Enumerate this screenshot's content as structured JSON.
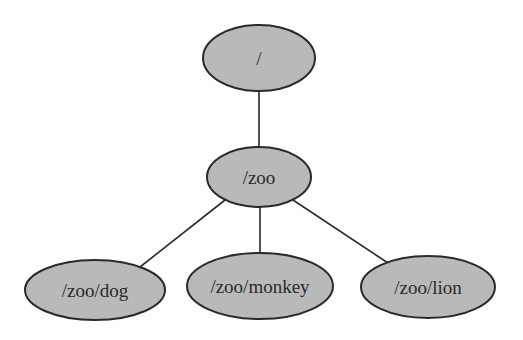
{
  "diagram": {
    "type": "tree",
    "fill_color": "#b9b9b9",
    "stroke_color": "#2a2a2a",
    "background": "#ffffff",
    "nodes": [
      {
        "id": "root",
        "label": "/",
        "cx": 259,
        "cy": 58,
        "rx": 56,
        "ry": 33
      },
      {
        "id": "zoo",
        "label": "/zoo",
        "cx": 259,
        "cy": 177,
        "rx": 52,
        "ry": 30
      },
      {
        "id": "dog",
        "label": "/zoo/dog",
        "cx": 95,
        "cy": 290,
        "rx": 70,
        "ry": 30
      },
      {
        "id": "monkey",
        "label": "/zoo/monkey",
        "cx": 260,
        "cy": 286,
        "rx": 73,
        "ry": 33
      },
      {
        "id": "lion",
        "label": "/zoo/lion",
        "cx": 428,
        "cy": 287,
        "rx": 67,
        "ry": 31
      }
    ],
    "edges": [
      {
        "from": "root",
        "to": "zoo",
        "x1": 259,
        "y1": 91,
        "x2": 259,
        "y2": 147
      },
      {
        "from": "zoo",
        "to": "dog",
        "x1": 225,
        "y1": 200,
        "x2": 140,
        "y2": 267
      },
      {
        "from": "zoo",
        "to": "monkey",
        "x1": 260,
        "y1": 207,
        "x2": 260,
        "y2": 253
      },
      {
        "from": "zoo",
        "to": "lion",
        "x1": 293,
        "y1": 200,
        "x2": 388,
        "y2": 263
      }
    ]
  }
}
